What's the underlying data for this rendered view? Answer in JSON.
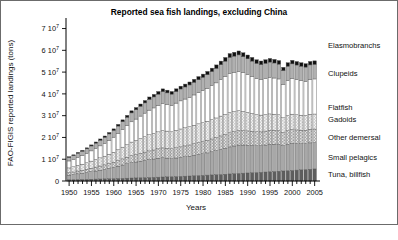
{
  "chart_data": {
    "type": "bar",
    "stacked": true,
    "title": "Reported sea fish landings, excluding China",
    "xlabel": "Years",
    "ylabel": "FAO-FIGIS reported landings (tons)",
    "xlim": [
      1949.3,
      2006.2
    ],
    "ylim": [
      0,
      73000000
    ],
    "grid": false,
    "legend_position": "right",
    "y_ticks": [
      0,
      10000000,
      20000000,
      30000000,
      40000000,
      50000000,
      60000000,
      70000000
    ],
    "y_tick_labels": [
      "0",
      "1 10",
      "2 10",
      "3 10",
      "4 10",
      "5 10",
      "6 10",
      "7 10"
    ],
    "y_tick_exponents": [
      "",
      "7",
      "7",
      "7",
      "7",
      "7",
      "7",
      "7"
    ],
    "x_ticks": [
      1950,
      1955,
      1960,
      1965,
      1970,
      1975,
      1980,
      1985,
      1990,
      1995,
      2000,
      2005
    ],
    "x_tick_labels": [
      "1950",
      "1955",
      "1960",
      "1965",
      "1970",
      "1975",
      "1980",
      "1985",
      "1990",
      "1995",
      "2000",
      "2005"
    ],
    "x": [
      1950,
      1951,
      1952,
      1953,
      1954,
      1955,
      1956,
      1957,
      1958,
      1959,
      1960,
      1961,
      1962,
      1963,
      1964,
      1965,
      1966,
      1967,
      1968,
      1969,
      1970,
      1971,
      1972,
      1973,
      1974,
      1975,
      1976,
      1977,
      1978,
      1979,
      1980,
      1981,
      1982,
      1983,
      1984,
      1985,
      1986,
      1987,
      1988,
      1989,
      1990,
      1991,
      1992,
      1993,
      1994,
      1995,
      1996,
      1997,
      1998,
      1999,
      2000,
      2001,
      2002,
      2003,
      2004,
      2005
    ],
    "series": [
      {
        "name": "Tuna, billfish",
        "fill": "#5e5e5e",
        "values": [
          600000,
          640000,
          690000,
          720000,
          770000,
          830000,
          880000,
          930000,
          1000000,
          1060000,
          1120000,
          1180000,
          1240000,
          1300000,
          1370000,
          1430000,
          1500000,
          1560000,
          1630000,
          1700000,
          1770000,
          1840000,
          1910000,
          1980000,
          2060000,
          2140000,
          2220000,
          2300000,
          2400000,
          2500000,
          2600000,
          2700000,
          2800000,
          2900000,
          3000000,
          3120000,
          3250000,
          3380000,
          3500000,
          3600000,
          3700000,
          3800000,
          3900000,
          4000000,
          4120000,
          4250000,
          4380000,
          4500000,
          4620000,
          4750000,
          4880000,
          5000000,
          5120000,
          5250000,
          5400000,
          5550000
        ]
      },
      {
        "name": "Small pelagics",
        "fill": "#a8a8a8",
        "values": [
          2100000,
          2300000,
          2600000,
          2800000,
          3100000,
          3400000,
          3700000,
          4000000,
          4300000,
          4700000,
          5100000,
          5600000,
          6100000,
          6600000,
          7100000,
          7300000,
          7600000,
          7900000,
          8200000,
          8400000,
          8700000,
          8900000,
          8600000,
          8300000,
          8500000,
          8700000,
          8900000,
          9100000,
          9400000,
          9700000,
          9900000,
          10200000,
          10600000,
          11000000,
          11500000,
          11900000,
          12400000,
          12700000,
          13000000,
          12900000,
          12700000,
          12500000,
          12300000,
          12200000,
          12400000,
          12600000,
          12500000,
          12300000,
          11600000,
          12100000,
          12400000,
          12200000,
          12000000,
          11900000,
          12100000,
          12000000
        ]
      },
      {
        "name": "Other demersal",
        "fill": "#cfcfcf",
        "pattern": "checker",
        "values": [
          1100000,
          1200000,
          1300000,
          1400000,
          1500000,
          1650000,
          1800000,
          1950000,
          2100000,
          2250000,
          2400000,
          2600000,
          2800000,
          3000000,
          3200000,
          3400000,
          3600000,
          3800000,
          4000000,
          4150000,
          4300000,
          4450000,
          4500000,
          4550000,
          4700000,
          4850000,
          5000000,
          5150000,
          5300000,
          5450000,
          5600000,
          5750000,
          5900000,
          6050000,
          6200000,
          6350000,
          6500000,
          6600000,
          6700000,
          6650000,
          6600000,
          6500000,
          6400000,
          6350000,
          6400000,
          6450000,
          6400000,
          6350000,
          6000000,
          6200000,
          6300000,
          6250000,
          6200000,
          6150000,
          6250000,
          6300000
        ]
      },
      {
        "name": "Gadoids",
        "fill": "#e8e8e8",
        "pattern": "checker-light",
        "values": [
          2200000,
          2400000,
          2600000,
          2800000,
          3000000,
          3250000,
          3500000,
          3750000,
          4000000,
          4300000,
          4600000,
          5000000,
          5400000,
          5800000,
          6200000,
          6500000,
          6800000,
          7100000,
          7400000,
          7600000,
          7800000,
          8000000,
          7900000,
          7800000,
          8000000,
          8200000,
          8300000,
          8400000,
          8500000,
          8600000,
          8700000,
          8800000,
          8900000,
          9000000,
          9100000,
          9200000,
          9300000,
          9200000,
          9100000,
          8800000,
          8500000,
          8200000,
          7900000,
          7700000,
          7600000,
          7500000,
          7400000,
          7300000,
          6800000,
          7000000,
          7100000,
          7000000,
          6900000,
          6800000,
          6900000,
          6900000
        ]
      },
      {
        "name": "Flatfish",
        "fill": "#ffffff",
        "values": [
          3200000,
          3400000,
          3700000,
          4000000,
          4300000,
          4700000,
          5100000,
          5500000,
          5900000,
          6400000,
          6900000,
          7500000,
          8100000,
          8700000,
          9300000,
          9800000,
          10300000,
          10800000,
          11300000,
          11700000,
          12100000,
          12500000,
          12300000,
          12100000,
          12500000,
          12900000,
          13200000,
          13500000,
          13900000,
          14300000,
          14700000,
          15100000,
          15600000,
          16100000,
          16700000,
          17300000,
          17900000,
          18000000,
          18100000,
          17800000,
          17400000,
          17000000,
          16600000,
          16400000,
          16600000,
          16800000,
          16600000,
          16400000,
          15300000,
          16000000,
          16300000,
          16100000,
          15900000,
          15700000,
          16000000,
          16100000
        ]
      },
      {
        "name": "Clupeids",
        "fill": "#b0b0b0",
        "values": [
          1600000,
          1700000,
          1850000,
          1950000,
          2100000,
          2250000,
          2400000,
          2600000,
          2750000,
          2900000,
          3100000,
          3350000,
          3600000,
          3850000,
          4100000,
          4300000,
          4500000,
          4700000,
          4900000,
          5050000,
          5200000,
          5350000,
          5250000,
          5150000,
          5300000,
          5450000,
          5550000,
          5650000,
          5800000,
          5950000,
          6100000,
          6250000,
          6450000,
          6650000,
          6900000,
          7150000,
          7400000,
          7450000,
          7500000,
          7350000,
          7200000,
          7050000,
          6900000,
          6800000,
          6900000,
          7000000,
          6900000,
          6800000,
          6350000,
          6650000,
          6800000,
          6700000,
          6600000,
          6500000,
          6650000,
          6700000
        ]
      },
      {
        "name": "Elasmobranchs",
        "fill": "#111111",
        "values": [
          350000,
          380000,
          400000,
          430000,
          460000,
          500000,
          540000,
          580000,
          620000,
          670000,
          720000,
          780000,
          840000,
          900000,
          960000,
          1000000,
          1050000,
          1100000,
          1150000,
          1180000,
          1220000,
          1260000,
          1240000,
          1220000,
          1260000,
          1300000,
          1330000,
          1360000,
          1400000,
          1440000,
          1480000,
          1520000,
          1560000,
          1600000,
          1650000,
          1700000,
          1760000,
          1780000,
          1800000,
          1770000,
          1740000,
          1700000,
          1660000,
          1640000,
          1660000,
          1680000,
          1660000,
          1640000,
          1530000,
          1600000,
          1630000,
          1610000,
          1590000,
          1570000,
          1600000,
          1610000
        ]
      }
    ],
    "legend_entries": [
      {
        "label": "Elasmobranchs",
        "y_px": 48
      },
      {
        "label": "Clupeids",
        "y_px": 76
      },
      {
        "label": "Flatfish",
        "y_px": 110
      },
      {
        "label": "Gadoids",
        "y_px": 122
      },
      {
        "label": "Other demersal",
        "y_px": 140
      },
      {
        "label": "Small pelagics",
        "y_px": 160
      },
      {
        "label": "Tuna, billfish",
        "y_px": 177
      }
    ]
  }
}
